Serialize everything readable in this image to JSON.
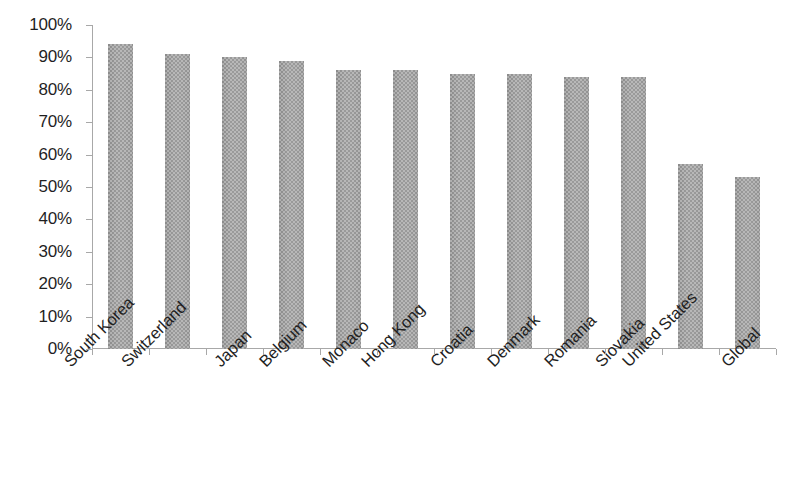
{
  "chart_data": {
    "type": "bar",
    "title": "",
    "subtitle": "",
    "xlabel": "",
    "ylabel": "",
    "categories": [
      "South Korea",
      "Switzerland",
      "Japan",
      "Belgium",
      "Monaco",
      "Hong Kong",
      "Croatia",
      "Denmark",
      "Romania",
      "Slovakia",
      "United States",
      "Global"
    ],
    "values": [
      94,
      91,
      90,
      89,
      86,
      86,
      85,
      85,
      84,
      84,
      57,
      53
    ],
    "value_labels": [
      "94%",
      "91%",
      "90%",
      "89%",
      "86%",
      "86%",
      "85%",
      "85%",
      "84%",
      "84%",
      "57%",
      "53%"
    ],
    "ylim": [
      0,
      100
    ],
    "ytick_values": [
      0,
      10,
      20,
      30,
      40,
      50,
      60,
      70,
      80,
      90,
      100
    ],
    "ytick_labels": [
      "0%",
      "10%",
      "20%",
      "30%",
      "40%",
      "50%",
      "60%",
      "70%",
      "80%",
      "90%",
      "100%"
    ],
    "grid": false,
    "legend": false,
    "legend_position": "none",
    "bar_color": "#9a9a9a",
    "axis_color": "#a8a8a8",
    "background_color": "#ffffff",
    "text_color": "#1f1f1f",
    "xtick_rotation": -45
  }
}
